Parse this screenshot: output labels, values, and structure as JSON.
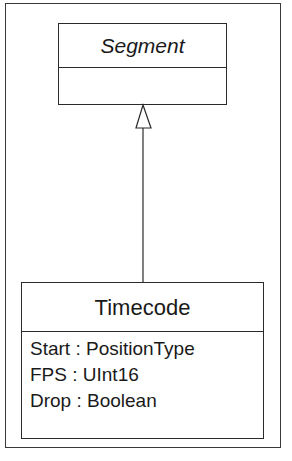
{
  "diagram": {
    "type": "UML class diagram",
    "relationship": "generalization",
    "parent": {
      "name": "Segment",
      "abstract": true,
      "attributes": []
    },
    "child": {
      "name": "Timecode",
      "attributes": [
        "Start : PositionType",
        "FPS : UInt16",
        "Drop : Boolean"
      ]
    },
    "colors": {
      "line": "#2a2a2a",
      "background": "#ffffff"
    }
  }
}
